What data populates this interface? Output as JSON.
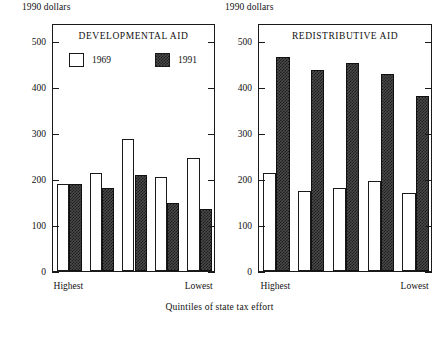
{
  "figure": {
    "shared_xlabel": "Quintiles of state tax effort",
    "units_label": "1990 dollars"
  },
  "legend": {
    "items": [
      {
        "label": "1969",
        "style": "open"
      },
      {
        "label": "1991",
        "style": "filled"
      }
    ]
  },
  "axis": {
    "yticks": [
      0,
      100,
      200,
      300,
      400,
      500
    ],
    "ytick_labels": [
      "0",
      "100",
      "200",
      "300",
      "400",
      "500"
    ],
    "xtick_labels": [
      "Highest",
      "Lowest"
    ]
  },
  "chart_data": [
    {
      "type": "bar",
      "title": "DEVELOPMENTAL AID",
      "xlabel": "Quintiles of state tax effort",
      "ylabel": "1990 dollars",
      "ylim": [
        0,
        540
      ],
      "grid": false,
      "legend_position": "upper-left-inside",
      "categories": [
        "Highest",
        "2nd",
        "3rd",
        "4th",
        "Lowest"
      ],
      "category_axis_labels": [
        "Highest",
        "Lowest"
      ],
      "series": [
        {
          "name": "1969",
          "values": [
            190,
            213,
            287,
            205,
            246
          ]
        },
        {
          "name": "1991",
          "values": [
            190,
            180,
            209,
            148,
            136
          ]
        }
      ]
    },
    {
      "type": "bar",
      "title": "REDISTRIBUTIVE AID",
      "xlabel": "Quintiles of state tax effort",
      "ylabel": "1990 dollars",
      "ylim": [
        0,
        540
      ],
      "grid": false,
      "legend_position": "none",
      "categories": [
        "Highest",
        "2nd",
        "3rd",
        "4th",
        "Lowest"
      ],
      "category_axis_labels": [
        "Highest",
        "Lowest"
      ],
      "series": [
        {
          "name": "1969",
          "values": [
            213,
            175,
            181,
            196,
            169
          ]
        },
        {
          "name": "1991",
          "values": [
            467,
            437,
            453,
            430,
            381
          ]
        }
      ]
    }
  ]
}
